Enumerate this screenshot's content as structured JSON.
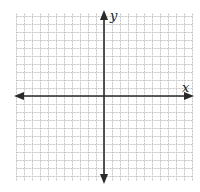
{
  "figure": {
    "type": "coordinate-plane",
    "x_axis_label": "x",
    "y_axis_label": "y",
    "grid": true,
    "ticks_labeled": false
  },
  "layout": {
    "width": 200,
    "height": 192,
    "grid_left": 16,
    "grid_top": 13,
    "grid_right": 192,
    "grid_bottom": 181,
    "grid_spacing": 8,
    "origin_x": 104,
    "origin_y": 96
  },
  "colors": {
    "background": "#ffffff",
    "grid_line": "#c4c4c4",
    "axis": "#2a2a2a",
    "label": "#222222"
  }
}
